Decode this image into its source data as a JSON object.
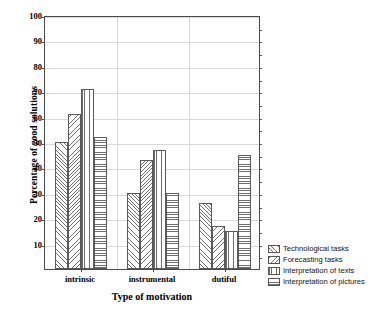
{
  "chart_data": {
    "type": "bar",
    "title": "",
    "xlabel": "Type of motivation",
    "ylabel": "Percentage of good solutions",
    "categories": [
      "intrinsic",
      "instrumental",
      "dutiful"
    ],
    "ylim": [
      0,
      100
    ],
    "yticks": [
      0,
      10,
      20,
      30,
      40,
      50,
      60,
      70,
      80,
      90,
      100
    ],
    "ytick_labels": [
      "",
      "10",
      "20",
      "30",
      "40",
      "50",
      "60",
      "70",
      "80",
      "90",
      "100"
    ],
    "grid": true,
    "legend_position": "right-bottom",
    "series": [
      {
        "name": "Technological tasks",
        "pattern": "diagonal-up",
        "values": [
          50,
          30,
          26
        ]
      },
      {
        "name": "Forecasting tasks",
        "pattern": "diagonal-down",
        "values": [
          61,
          43,
          17
        ]
      },
      {
        "name": "Interpretation of texts",
        "pattern": "vertical",
        "values": [
          71,
          47,
          15
        ]
      },
      {
        "name": "Interpretation of pictures",
        "pattern": "horizontal",
        "values": [
          52,
          30,
          45
        ]
      }
    ]
  },
  "axis": {
    "y_title": "Percentage of good solutions",
    "x_title": "Type of motivation"
  },
  "colors": {
    "frame": "#4a4a4a",
    "grid": "#d9d9d9",
    "hatch": "#6e6e6e",
    "background": "#ffffff",
    "text": "#000000"
  }
}
